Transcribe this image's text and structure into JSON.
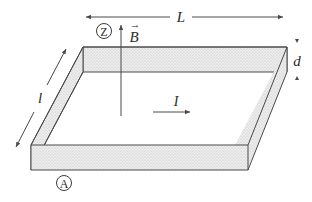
{
  "diagram": {
    "labels": {
      "length": "L",
      "width": "l",
      "thickness": "d",
      "magnetic_field": "B",
      "field_vector_mark": "→",
      "current": "I",
      "point_z": "Z",
      "point_a": "A"
    },
    "colors": {
      "stroke": "#4a4a4a",
      "fill": "#e4e4e4",
      "text": "#2a2a2a"
    }
  }
}
